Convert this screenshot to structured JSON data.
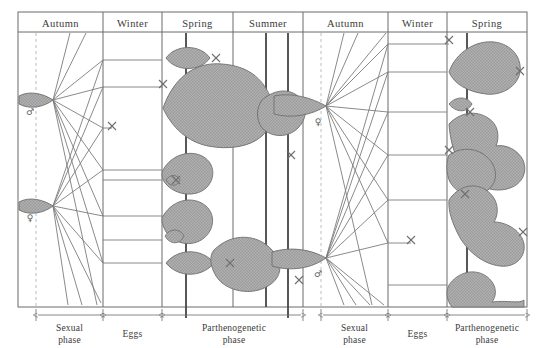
{
  "figure": {
    "colors": {
      "frame": "#6b6b6b",
      "line": "#7a7a7a",
      "blob_fill": "#a9a9a9",
      "blob_stroke": "#6f6f6f",
      "dashed": "#b9b9b9",
      "heavy": "#555555",
      "text": "#3a3a3a",
      "background": "#ffffff"
    }
  },
  "columns": [
    {
      "label": "Autumn",
      "x0": 18,
      "x1": 103
    },
    {
      "label": "Winter",
      "x0": 103,
      "x1": 162
    },
    {
      "label": "Spring",
      "x0": 162,
      "x1": 233
    },
    {
      "label": "Summer",
      "x0": 233,
      "x1": 303
    },
    {
      "label": "Autumn",
      "x0": 303,
      "x1": 388
    },
    {
      "label": "Winter",
      "x0": 388,
      "x1": 447
    },
    {
      "label": "Spring",
      "x0": 447,
      "x1": 527
    }
  ],
  "phases": [
    {
      "label_line1": "Sexual",
      "label_line2": "phase",
      "x0": 36,
      "x1": 103
    },
    {
      "label_line1": "Eggs",
      "label_line2": "",
      "x0": 103,
      "x1": 162
    },
    {
      "label_line1": "Parthenogenetic",
      "label_line2": "phase",
      "x0": 162,
      "x1": 303
    },
    {
      "label_line1": "Sexual",
      "label_line2": "phase",
      "x0": 321,
      "x1": 388
    },
    {
      "label_line1": "Eggs",
      "label_line2": "",
      "x0": 388,
      "x1": 447
    },
    {
      "label_line1": "Parthenogenetic",
      "label_line2": "phase",
      "x0": 447,
      "x1": 527
    }
  ],
  "sex_symbols": [
    {
      "symbol": "♂",
      "name": "male-symbol",
      "x": 30,
      "y": 112
    },
    {
      "symbol": "♀",
      "name": "female-symbol",
      "x": 30,
      "y": 218
    },
    {
      "symbol": "♀",
      "name": "female-symbol",
      "x": 318,
      "y": 122
    },
    {
      "symbol": "♂",
      "name": "male-symbol",
      "x": 318,
      "y": 274
    }
  ],
  "fan_nodes": [
    {
      "name": "fan-node-male-autumn-1",
      "x": 53,
      "y": 100
    },
    {
      "name": "fan-node-female-autumn-1",
      "x": 53,
      "y": 206
    },
    {
      "name": "fan-node-female-autumn-2",
      "x": 326,
      "y": 106
    },
    {
      "name": "fan-node-male-autumn-2",
      "x": 326,
      "y": 258
    }
  ],
  "cross_marks": [
    {
      "name": "cross-mark",
      "x": 216,
      "y": 58
    },
    {
      "name": "cross-mark",
      "x": 163,
      "y": 84
    },
    {
      "name": "cross-mark",
      "x": 112,
      "y": 126
    },
    {
      "name": "cross-mark",
      "x": 291,
      "y": 155
    },
    {
      "name": "cross-mark",
      "x": 176,
      "y": 180
    },
    {
      "name": "cross-mark",
      "x": 230,
      "y": 263
    },
    {
      "name": "cross-mark",
      "x": 299,
      "y": 280
    },
    {
      "name": "cross-mark",
      "x": 449,
      "y": 40
    },
    {
      "name": "cross-mark",
      "x": 520,
      "y": 71
    },
    {
      "name": "cross-mark",
      "x": 449,
      "y": 150
    },
    {
      "name": "cross-mark",
      "x": 411,
      "y": 240
    },
    {
      "name": "cross-mark",
      "x": 523,
      "y": 232
    },
    {
      "name": "cross-mark",
      "x": 465,
      "y": 194
    }
  ],
  "geometry": {
    "frame": {
      "x": 18,
      "y": 12,
      "width": 509,
      "height": 295
    },
    "header_bottom_y": 32,
    "chart_bottom_y": 307,
    "heavy_verts": [
      186,
      266,
      288,
      467
    ],
    "dashed_verts": [
      36,
      321
    ]
  },
  "egg_rails": {
    "left": [
      60,
      87,
      128,
      170,
      216,
      263
    ],
    "right": [
      44,
      72,
      112,
      155,
      200,
      243
    ]
  }
}
